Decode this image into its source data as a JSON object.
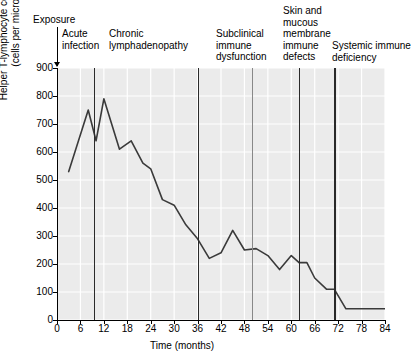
{
  "chart_data": {
    "type": "line",
    "title": "",
    "xlabel": "Time (months)",
    "ylabel": "Helper T-lymphocyte concentration (cells per microliter)",
    "ylabel_line1": "Helper T-lymphocyte concentration",
    "ylabel_line2": "(cells per microliter)",
    "xlim": [
      0,
      84
    ],
    "ylim": [
      0,
      900
    ],
    "xticks": [
      0,
      6,
      12,
      18,
      24,
      30,
      36,
      42,
      48,
      54,
      60,
      66,
      72,
      78,
      84
    ],
    "yticks": [
      0,
      100,
      200,
      300,
      400,
      500,
      600,
      700,
      800,
      900
    ],
    "grid": true,
    "legend": "none",
    "series": [
      {
        "name": "Helper T-lymphocyte concentration",
        "color": "#3a3a3a",
        "x": [
          3,
          8,
          10,
          12,
          16,
          19,
          22,
          24,
          27,
          30,
          33,
          36,
          39,
          42,
          45,
          48,
          51,
          54,
          57,
          60,
          62,
          64,
          66,
          69,
          71,
          74,
          77,
          80,
          84
        ],
        "values": [
          530,
          750,
          640,
          790,
          610,
          640,
          560,
          540,
          430,
          410,
          340,
          290,
          220,
          240,
          320,
          250,
          255,
          230,
          180,
          230,
          205,
          205,
          150,
          110,
          110,
          40,
          40,
          40,
          40
        ]
      }
    ],
    "markers": [
      {
        "name": "exposure",
        "x": 0,
        "style": "arrow",
        "label": "Exposure"
      },
      {
        "name": "acute-infection",
        "x": 9.5,
        "style": "thick",
        "label": "Acute infection"
      },
      {
        "name": "chronic-lymphadenopathy",
        "x": 36,
        "style": "thick",
        "label": "Chronic lymphadenopathy"
      },
      {
        "name": "subclinical-immune-dysfunction",
        "x": 50,
        "style": "thin",
        "label": "Subclinical immune dysfunction"
      },
      {
        "name": "skin-mucous-membrane-immune-defects",
        "x": 62,
        "style": "thick",
        "label": "Skin and mucous membrane immune defects"
      },
      {
        "name": "systemic-immune-deficiency",
        "x": 71,
        "style": "thick",
        "label": "Systemic immune deficiency"
      }
    ],
    "colors": {
      "plot_background": "#ebebeb",
      "gridline": "#ffffff",
      "line": "#3a3a3a",
      "marker": "#2a2a2a",
      "marker_thin": "#888888",
      "axis": "#000000"
    }
  },
  "annotations": {
    "exposure": "Exposure",
    "acute_l1": "Acute",
    "acute_l2": "infection",
    "chronic_l1": "Chronic",
    "chronic_l2": "lymphadenopathy",
    "subclinical_l1": "Subclinical",
    "subclinical_l2": "immune",
    "subclinical_l3": "dysfunction",
    "skin_l1": "Skin and",
    "skin_l2": "mucous",
    "skin_l3": "membrane",
    "skin_l4": "immune",
    "skin_l5": "defects",
    "systemic_l1": "Systemic immune",
    "systemic_l2": "deficiency"
  }
}
